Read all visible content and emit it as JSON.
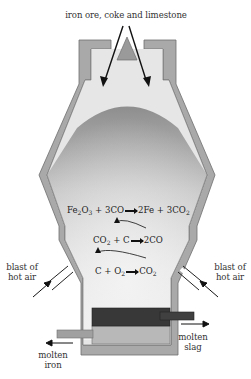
{
  "diagram": {
    "labels": {
      "top_input": "iron ore, coke and limestone",
      "blast_left_line1": "blast of",
      "blast_left_line2": "hot air",
      "blast_right_line1": "blast of",
      "blast_right_line2": "hot air",
      "molten_iron_line1": "molten",
      "molten_iron_line2": "iron",
      "molten_slag_line1": "molten",
      "molten_slag_line2": "slag"
    },
    "reactions": [
      {
        "id": "reduction",
        "lhs": [
          {
            "t": "Fe"
          },
          {
            "sub": "2"
          },
          {
            "t": "O"
          },
          {
            "sub": "3"
          },
          {
            "t": " + 3CO"
          }
        ],
        "rhs": [
          {
            "t": "2Fe + 3CO"
          },
          {
            "sub": "2"
          }
        ]
      },
      {
        "id": "co-formation",
        "lhs": [
          {
            "t": "CO"
          },
          {
            "sub": "2"
          },
          {
            "t": " + C"
          }
        ],
        "rhs": [
          {
            "t": "2CO"
          }
        ]
      },
      {
        "id": "combustion",
        "lhs": [
          {
            "t": "C + O"
          },
          {
            "sub": "2"
          }
        ],
        "rhs": [
          {
            "t": "CO"
          },
          {
            "sub": "2"
          }
        ]
      }
    ],
    "colors": {
      "wall": "#a9a9a9",
      "wall_outline": "#6e6e6e",
      "chamber_light": "#e6e6e6",
      "charge_top": "#9a9a9a",
      "slag": "#3a3a3a",
      "iron": "#b5b5b5",
      "arrow": "#111111"
    }
  }
}
